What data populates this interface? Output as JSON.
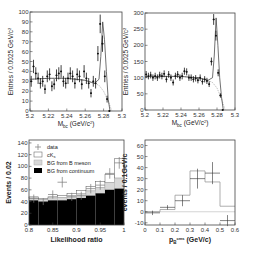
{
  "chart_data": [
    {
      "id": "mbc-left",
      "type": "scatter",
      "title": "",
      "xlabel": "M_bc (GeV/c^2)",
      "ylabel": "Entries / 0.0025 GeV/c^2",
      "xlim": [
        5.2,
        5.3
      ],
      "ylim": [
        0,
        100
      ],
      "xticks": [
        "5.2",
        "5.22",
        "5.24",
        "5.26",
        "5.28",
        "5.3"
      ],
      "yticks": [
        "0",
        "10",
        "20",
        "30",
        "40",
        "50",
        "60",
        "70",
        "80",
        "90",
        "100"
      ],
      "series": [
        {
          "name": "data",
          "x": [
            5.2013,
            5.2038,
            5.2063,
            5.2088,
            5.2113,
            5.2138,
            5.2163,
            5.2188,
            5.2213,
            5.2238,
            5.2263,
            5.2288,
            5.2313,
            5.2338,
            5.2363,
            5.2388,
            5.2413,
            5.2438,
            5.2463,
            5.2488,
            5.2513,
            5.2538,
            5.2563,
            5.2588,
            5.2613,
            5.2638,
            5.2663,
            5.2688,
            5.2713,
            5.2738,
            5.2763,
            5.2788,
            5.2813,
            5.2838,
            5.2863
          ],
          "y": [
            30,
            45,
            38,
            33,
            28,
            30,
            22,
            35,
            37,
            25,
            27,
            36,
            38,
            40,
            30,
            28,
            33,
            38,
            35,
            28,
            37,
            35,
            27,
            40,
            33,
            28,
            18,
            30,
            28,
            58,
            88,
            68,
            35,
            12,
            0
          ]
        },
        {
          "name": "fit",
          "x": [
            5.2,
            5.22,
            5.24,
            5.26,
            5.27,
            5.275,
            5.277,
            5.279,
            5.281,
            5.283,
            5.285,
            5.287
          ],
          "y": [
            32,
            33,
            33,
            31,
            28,
            32,
            55,
            90,
            72,
            40,
            12,
            0
          ]
        },
        {
          "name": "background",
          "x": [
            5.2,
            5.22,
            5.24,
            5.26,
            5.27,
            5.275,
            5.28,
            5.285,
            5.289
          ],
          "y": [
            32,
            33,
            33,
            31,
            28,
            26,
            20,
            10,
            0
          ]
        }
      ]
    },
    {
      "id": "mbc-right",
      "type": "scatter",
      "title": "",
      "xlabel": "M_bc (GeV/c^2)",
      "ylabel": "Entries / 0.0025 GeV/c^2",
      "xlim": [
        5.2,
        5.3
      ],
      "ylim": [
        0,
        300
      ],
      "xticks": [
        "5.2",
        "5.22",
        "5.24",
        "5.26",
        "5.28",
        "5.3"
      ],
      "yticks": [
        "0",
        "50",
        "100",
        "150",
        "200",
        "250",
        "300"
      ],
      "series": [
        {
          "name": "data",
          "x": [
            5.2013,
            5.2038,
            5.2063,
            5.2088,
            5.2113,
            5.2138,
            5.2163,
            5.2188,
            5.2213,
            5.2238,
            5.2263,
            5.2288,
            5.2313,
            5.2338,
            5.2363,
            5.2388,
            5.2413,
            5.2438,
            5.2463,
            5.2488,
            5.2513,
            5.2538,
            5.2563,
            5.2588,
            5.2613,
            5.2638,
            5.2663,
            5.2688,
            5.2713,
            5.2738,
            5.2763,
            5.2788,
            5.2813,
            5.2838,
            5.2863
          ],
          "y": [
            110,
            105,
            108,
            100,
            105,
            100,
            108,
            105,
            112,
            95,
            110,
            100,
            85,
            105,
            110,
            100,
            105,
            120,
            118,
            100,
            100,
            95,
            98,
            92,
            100,
            88,
            95,
            90,
            80,
            150,
            280,
            230,
            115,
            45,
            0
          ]
        },
        {
          "name": "fit",
          "x": [
            5.2,
            5.22,
            5.24,
            5.26,
            5.27,
            5.275,
            5.277,
            5.279,
            5.281,
            5.283,
            5.285,
            5.287
          ],
          "y": [
            103,
            104,
            104,
            99,
            92,
            100,
            170,
            285,
            200,
            100,
            40,
            0
          ]
        },
        {
          "name": "background",
          "x": [
            5.2,
            5.22,
            5.24,
            5.26,
            5.27,
            5.275,
            5.28,
            5.285,
            5.289
          ],
          "y": [
            103,
            104,
            104,
            99,
            92,
            85,
            68,
            35,
            0
          ]
        }
      ]
    },
    {
      "id": "likelihood",
      "type": "bar",
      "title": "",
      "xlabel": "Likelihood ratio",
      "ylabel": "Events / 0.02",
      "xlim": [
        0.8,
        1.0
      ],
      "ylim": [
        0,
        145
      ],
      "xticks": [
        "0.8",
        "0.85",
        "0.9",
        "0.95",
        "1"
      ],
      "yticks": [
        "0",
        "20",
        "40",
        "60",
        "80",
        "100",
        "120",
        "140"
      ],
      "bin_edges": [
        0.8,
        0.82,
        0.84,
        0.86,
        0.88,
        0.9,
        0.92,
        0.94,
        0.96,
        0.98,
        1.0
      ],
      "series": [
        {
          "name": "BG from continuum",
          "color": "#000000",
          "values": [
            42,
            40,
            42,
            42,
            44,
            46,
            50,
            54,
            60,
            62
          ]
        },
        {
          "name": "BG from B meson",
          "color": "#d8d8d8",
          "values": [
            4,
            3,
            4,
            5,
            6,
            7,
            8,
            10,
            12,
            18
          ]
        },
        {
          "name": "cK_s",
          "color": "#ffffff",
          "values": [
            2,
            2,
            2,
            3,
            4,
            6,
            8,
            10,
            14,
            33
          ]
        },
        {
          "name": "data",
          "x": [
            0.81,
            0.83,
            0.85,
            0.87,
            0.89,
            0.91,
            0.93,
            0.95,
            0.97,
            0.99
          ],
          "y": [
            45,
            40,
            52,
            73,
            48,
            50,
            62,
            68,
            88,
            106
          ],
          "yerr": [
            7,
            6,
            7,
            9,
            7,
            7,
            8,
            8,
            9,
            10
          ]
        }
      ],
      "legend": {
        "position": "upper left",
        "entries": [
          "data",
          "cK_s",
          "BG from B meson",
          "BG from continuum"
        ]
      }
    },
    {
      "id": "momentum",
      "type": "bar",
      "title": "",
      "xlabel": "p_B^cms (GeV/c)",
      "ylabel": "events / 0.1GeV/c",
      "xlim": [
        0,
        0.6
      ],
      "ylim": [
        -12,
        65
      ],
      "xticks": [
        "0",
        "0.1",
        "0.2",
        "0.3",
        "0.4",
        "0.5",
        "0.6"
      ],
      "yticks": [
        "-10",
        "0",
        "10",
        "20",
        "30",
        "40",
        "50",
        "60"
      ],
      "bin_edges": [
        0,
        0.1,
        0.2,
        0.3,
        0.4,
        0.5,
        0.6
      ],
      "series": [
        {
          "name": "expectation",
          "values": [
            0,
            2,
            15,
            37,
            27,
            5
          ]
        },
        {
          "name": "data",
          "x": [
            0.05,
            0.15,
            0.25,
            0.35,
            0.45,
            0.55
          ],
          "y": [
            -1,
            4,
            10,
            30,
            35,
            -8
          ],
          "yerr": [
            2,
            2,
            5,
            9,
            10,
            5
          ]
        }
      ]
    }
  ],
  "labels": {
    "tl_ylabel": "Entries / 0.0025 GeV/c",
    "tl_xlabel": "M",
    "tl_xlabel_sub": "bc",
    "tl_xlabel_unit": " (GeV/c",
    "tr_ylabel": "Entries / 0.0025 GeV/c",
    "bl_ylabel": "Events / 0.02",
    "bl_xlabel": "Likelihood ratio",
    "br_ylabel": "events / 0.1GeV/c",
    "br_xlabel": "p",
    "br_xlabel_sub": "B",
    "br_xlabel_sup": "cms",
    "br_xlabel_unit": " (GeV/c)",
    "legend": [
      "data",
      "cK",
      "BG from B meson",
      "BG from continuum"
    ],
    "legend_ck_sub": "s"
  }
}
